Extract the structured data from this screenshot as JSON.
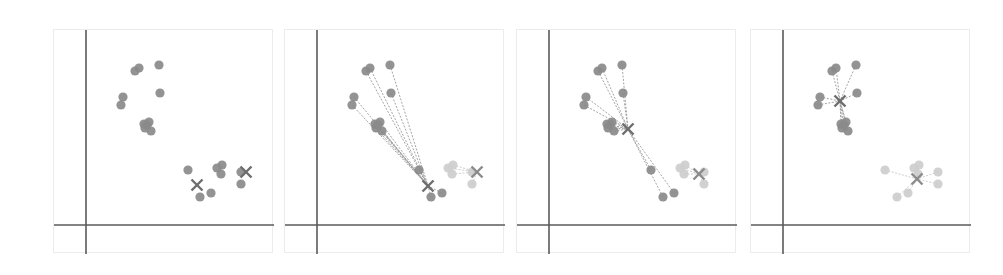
{
  "figure": {
    "panel_count": 4
  },
  "colors": {
    "dark_point": "#8a8a8a",
    "light_point": "#cdcdcd",
    "centroid_dark": "#6e6e6e",
    "centroid_light": "#8c8c8c",
    "axis": "#5a5a5a",
    "frame": "#ececec",
    "link_dark": "#9a9a9a",
    "link_light": "#c8c8c8"
  },
  "chart_data": {
    "type": "scatter",
    "title": "",
    "xlabel": "",
    "ylabel": "",
    "grid": false,
    "legend": "none",
    "axes_origin_px": {
      "x": 32,
      "y": 195
    },
    "points": [
      [
        81,
        41
      ],
      [
        85,
        38
      ],
      [
        105,
        35
      ],
      [
        106,
        63
      ],
      [
        69,
        67
      ],
      [
        67,
        75
      ],
      [
        90,
        94
      ],
      [
        95,
        92
      ],
      [
        91,
        98
      ],
      [
        97,
        101
      ],
      [
        93,
        95
      ],
      [
        134,
        140
      ],
      [
        163,
        138
      ],
      [
        168,
        135
      ],
      [
        167,
        144
      ],
      [
        146,
        167
      ],
      [
        157,
        163
      ],
      [
        187,
        142
      ],
      [
        187,
        154
      ]
    ],
    "panels": [
      {
        "name": "panel-1-initial",
        "left": 53,
        "show_links": false,
        "assign": [
          0,
          0,
          0,
          0,
          0,
          0,
          0,
          0,
          0,
          0,
          0,
          0,
          0,
          0,
          0,
          0,
          0,
          0,
          0
        ],
        "centroids": [
          {
            "x": 143,
            "y": 155,
            "shade": "dark"
          },
          {
            "x": 192,
            "y": 142,
            "shade": "dark"
          }
        ]
      },
      {
        "name": "panel-2-assign",
        "left": 284,
        "show_links": true,
        "assign": [
          0,
          0,
          0,
          0,
          0,
          0,
          0,
          0,
          0,
          0,
          0,
          0,
          1,
          1,
          1,
          0,
          0,
          1,
          1
        ],
        "centroids": [
          {
            "x": 143,
            "y": 156,
            "shade": "dark"
          },
          {
            "x": 192,
            "y": 142,
            "shade": "light"
          }
        ]
      },
      {
        "name": "panel-3-update",
        "left": 516,
        "show_links": true,
        "assign": [
          0,
          0,
          0,
          0,
          0,
          0,
          0,
          0,
          0,
          0,
          0,
          0,
          1,
          1,
          1,
          0,
          0,
          1,
          1
        ],
        "centroids": [
          {
            "x": 111,
            "y": 99,
            "shade": "dark"
          },
          {
            "x": 182,
            "y": 144,
            "shade": "light"
          }
        ]
      },
      {
        "name": "panel-4-converged",
        "left": 750,
        "show_links": true,
        "assign": [
          0,
          0,
          0,
          0,
          0,
          0,
          0,
          0,
          0,
          0,
          0,
          1,
          1,
          1,
          1,
          1,
          1,
          1,
          1
        ],
        "centroids": [
          {
            "x": 89,
            "y": 71,
            "shade": "dark"
          },
          {
            "x": 166,
            "y": 149,
            "shade": "light"
          }
        ]
      }
    ]
  }
}
